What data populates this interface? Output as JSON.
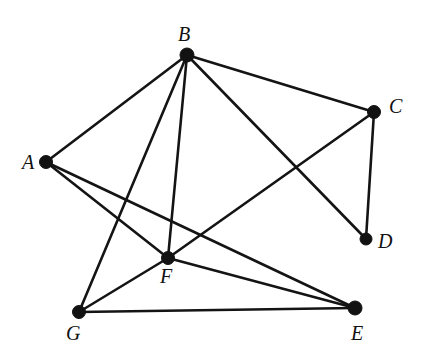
{
  "figure": {
    "background_color": "#ffffff",
    "edge_color": "#141414",
    "vertex_color": "#121212",
    "label_color": "#111111",
    "width": 421,
    "height": 362
  },
  "chart_data": {
    "type": "diagram",
    "diagram_kind": "undirected-graph",
    "title": "",
    "vertex_count": 7,
    "edge_count": 12,
    "vertices": [
      {
        "id": "A",
        "label": "A",
        "x": 46,
        "y": 162,
        "r": 6.5,
        "label_x": 22,
        "label_y": 152,
        "degree": 3
      },
      {
        "id": "B",
        "label": "B",
        "x": 187,
        "y": 55,
        "r": 7.0,
        "label_x": 178,
        "label_y": 24,
        "degree": 5
      },
      {
        "id": "C",
        "label": "C",
        "x": 374,
        "y": 112,
        "r": 6.5,
        "label_x": 389,
        "label_y": 96,
        "degree": 3
      },
      {
        "id": "D",
        "label": "D",
        "x": 366,
        "y": 239,
        "r": 6.0,
        "label_x": 378,
        "label_y": 231,
        "degree": 2
      },
      {
        "id": "E",
        "label": "E",
        "x": 355,
        "y": 308,
        "r": 7.0,
        "label_x": 351,
        "label_y": 323,
        "degree": 3
      },
      {
        "id": "F",
        "label": "F",
        "x": 168,
        "y": 258,
        "r": 6.5,
        "label_x": 160,
        "label_y": 266,
        "degree": 5
      },
      {
        "id": "G",
        "label": "G",
        "x": 79,
        "y": 312,
        "r": 6.5,
        "label_x": 66,
        "label_y": 323,
        "degree": 3
      }
    ],
    "edges": [
      {
        "from": "A",
        "to": "B"
      },
      {
        "from": "A",
        "to": "F"
      },
      {
        "from": "A",
        "to": "E"
      },
      {
        "from": "B",
        "to": "C"
      },
      {
        "from": "B",
        "to": "D"
      },
      {
        "from": "B",
        "to": "F"
      },
      {
        "from": "B",
        "to": "G"
      },
      {
        "from": "C",
        "to": "D"
      },
      {
        "from": "C",
        "to": "F"
      },
      {
        "from": "F",
        "to": "E"
      },
      {
        "from": "F",
        "to": "G"
      },
      {
        "from": "G",
        "to": "E"
      }
    ]
  }
}
